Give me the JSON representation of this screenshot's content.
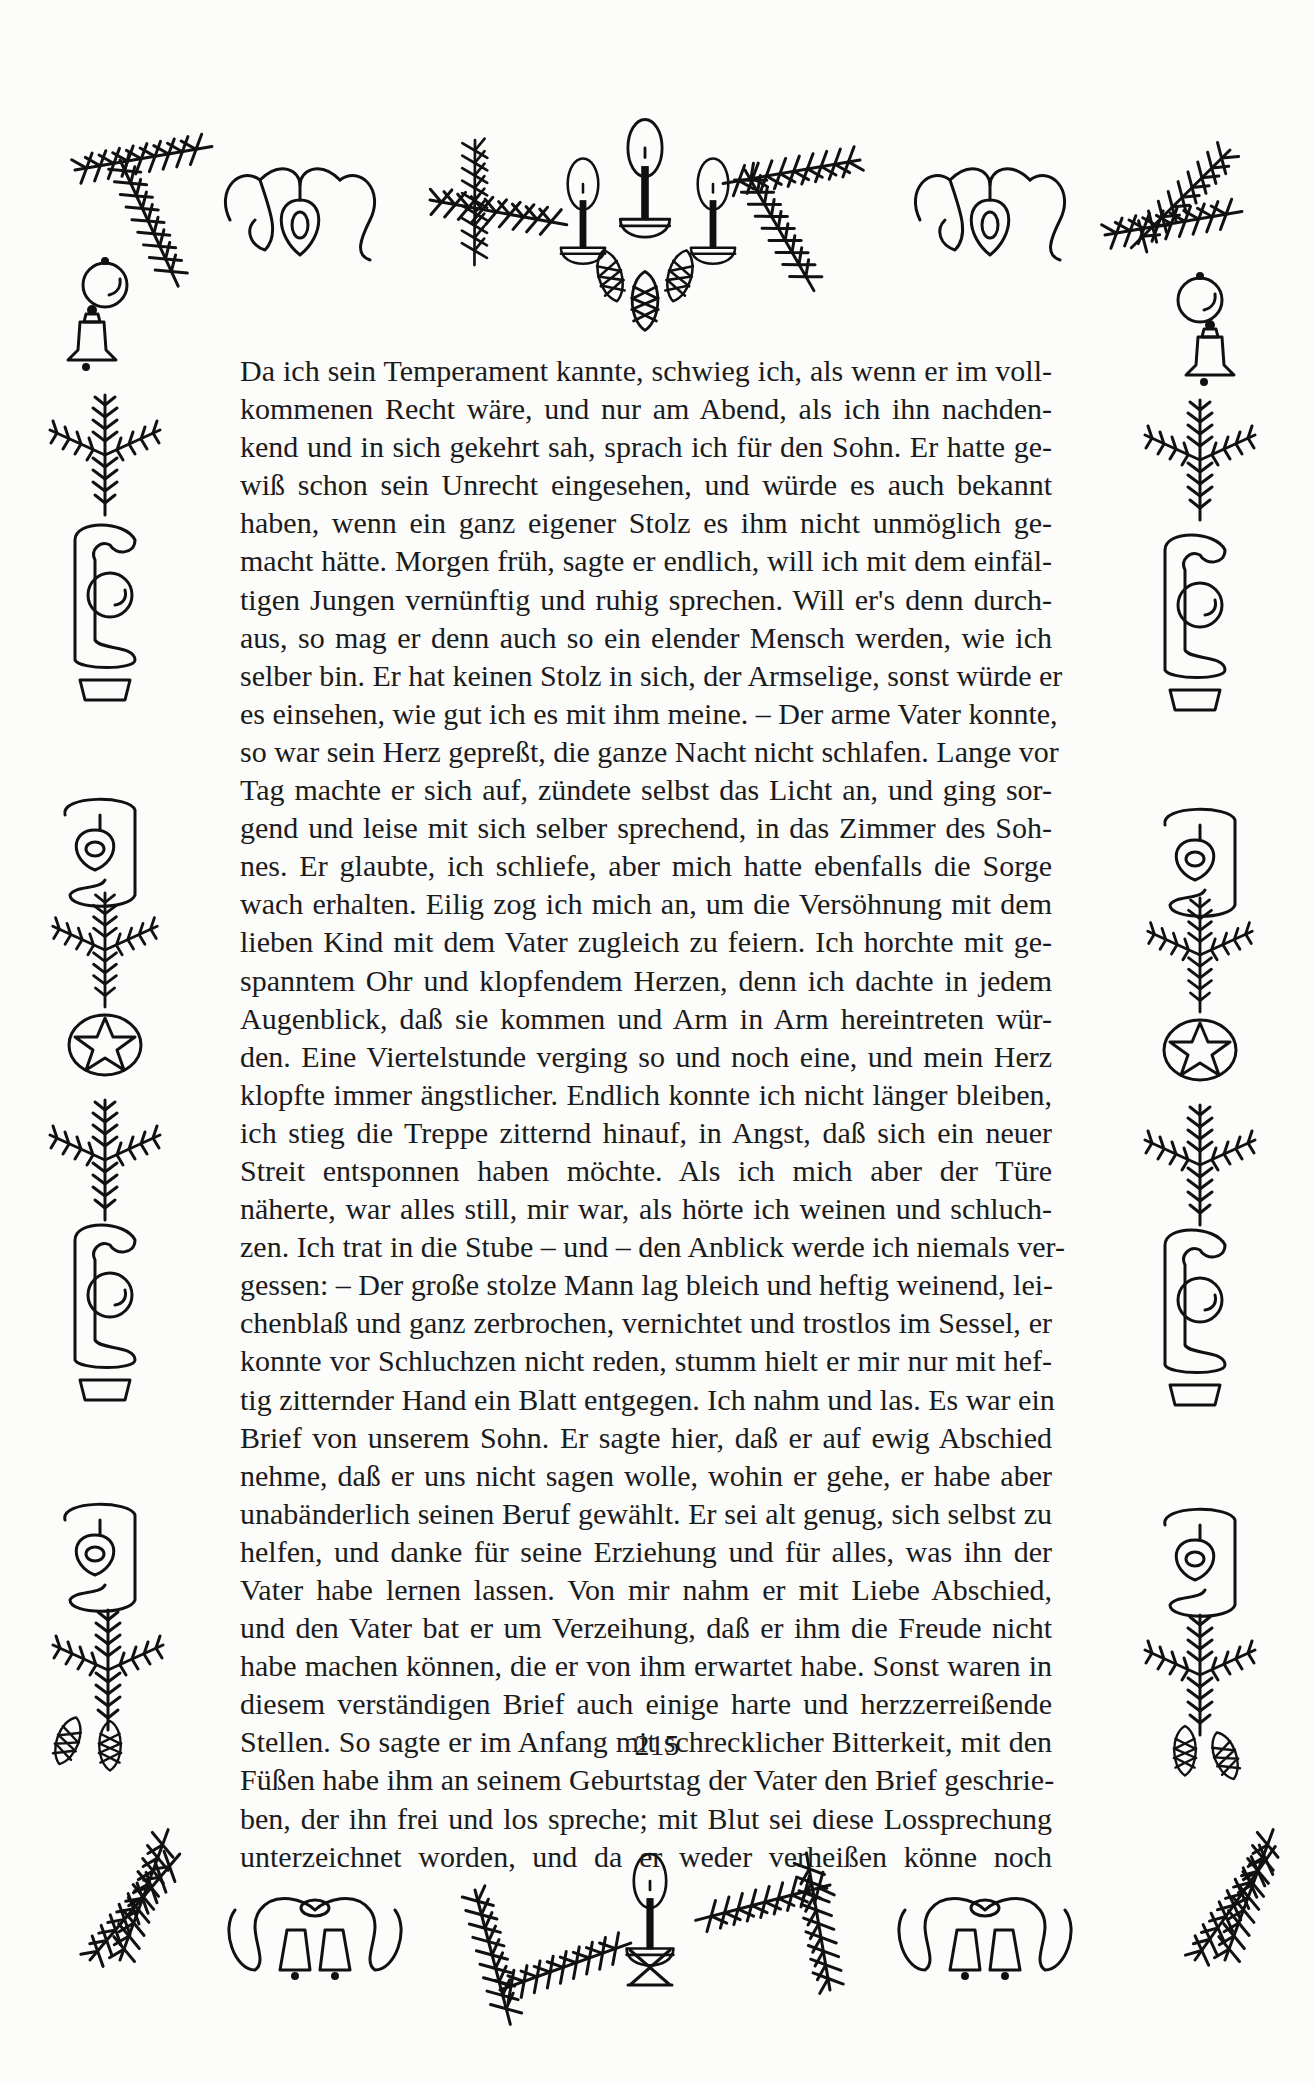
{
  "document": {
    "page_number": "215",
    "lines": [
      "Da ich sein Temperament kannte, schwieg ich, als wenn er im voll-",
      "kommenen Recht wäre, und nur am Abend, als ich ihn nachden-",
      "kend und in sich gekehrt sah, sprach ich für den Sohn. Er hatte ge-",
      "wiß schon sein Unrecht eingesehen, und würde es auch bekannt",
      "haben, wenn ein ganz eigener Stolz es ihm nicht unmöglich ge-",
      "macht hätte. Morgen früh, sagte er endlich, will ich mit dem einfäl-",
      "tigen Jungen vernünftig und ruhig sprechen. Will er's denn durch-",
      "aus, so mag er denn auch so ein elender Mensch werden, wie ich",
      "selber bin. Er hat keinen Stolz in sich, der Armselige, sonst würde er",
      "es einsehen, wie gut ich es mit ihm meine. – Der arme Vater konnte,",
      "so war sein Herz gepreßt, die ganze Nacht nicht schlafen. Lange vor",
      "Tag machte er sich auf, zündete selbst das Licht an, und ging sor-",
      "gend und leise mit sich selber sprechend, in das Zimmer des Soh-",
      "nes. Er glaubte, ich schliefe, aber mich hatte ebenfalls die Sorge",
      "wach erhalten. Eilig zog ich mich an, um die Versöhnung mit dem",
      "lieben Kind mit dem Vater zugleich zu feiern. Ich horchte mit ge-",
      "spanntem Ohr und klopfendem Herzen, denn ich dachte in jedem",
      "Augenblick, daß sie kommen und Arm in Arm hereintreten wür-",
      "den. Eine Viertelstunde verging so und noch eine, und mein Herz",
      "klopfte immer ängstlicher. Endlich konnte ich nicht länger bleiben,",
      "ich stieg die Treppe zitternd hinauf, in Angst, daß sich ein neuer",
      "Streit entsponnen haben möchte. Als ich mich aber der Türe",
      "näherte, war alles still, mir war, als hörte ich weinen und schluch-",
      "zen. Ich trat in die Stube – und – den Anblick werde ich niemals ver-",
      "gessen: – Der große stolze Mann lag bleich und heftig weinend, lei-",
      "chenblaß und ganz zerbrochen, vernichtet und trostlos im Sessel, er",
      "konnte vor Schluchzen nicht reden, stumm hielt er mir nur mit hef-",
      "tig zitternder Hand ein Blatt entgegen. Ich nahm und las. Es war ein",
      "Brief von unserem Sohn. Er sagte hier, daß er auf ewig Abschied",
      "nehme, daß er uns nicht sagen wolle, wohin er gehe, er habe aber",
      "unabänderlich seinen Beruf gewählt. Er sei alt genug, sich selbst zu",
      "helfen, und danke für seine Erziehung und für alles, was ihn der",
      "Vater habe lernen lassen. Von mir nahm er mit Liebe Abschied,",
      "und den Vater bat er um Verzeihung, daß er ihm die Freude nicht",
      "habe machen können, die er von ihm erwartet habe. Sonst waren in",
      "diesem verständigen Brief auch einige harte und herzzerreißende",
      "Stellen. So sagte er im Anfang mit schrecklicher Bitterkeit, mit den",
      "Füßen habe ihm an seinem Geburtstag der Vater den Brief geschrie-",
      "ben, der ihn frei und los spreche; mit Blut sei diese Lossprechung",
      "unterzeichnet worden, und da er weder verheißen könne noch"
    ]
  },
  "border": {
    "top": [
      "fir-branch-icon",
      "ribbon-bow-icon",
      "heart-ornament-icon",
      "fir-branch-icon",
      "three-candles-icon",
      "pine-cones-icon",
      "fir-branch-icon",
      "ribbon-bow-icon",
      "heart-ornament-icon",
      "fir-branch-icon"
    ],
    "sides": [
      "bauble-icon",
      "bell-icon",
      "fir-sprig-icon",
      "ribbon-scroll-icon",
      "bauble-icon",
      "heart-ornament-icon",
      "fir-sprig-icon",
      "star-ornament-icon",
      "fir-sprig-icon",
      "ribbon-scroll-icon",
      "bauble-icon",
      "heart-ornament-icon",
      "fir-sprig-icon",
      "pine-cones-icon",
      "fir-branch-icon"
    ],
    "bottom": [
      "fir-branch-icon",
      "ribbon-bow-icon",
      "bells-icon",
      "fir-branch-icon",
      "single-candle-icon",
      "fir-branch-icon",
      "ribbon-bow-icon",
      "bells-icon",
      "fir-branch-icon"
    ],
    "ink_color": "#111111",
    "paper_color": "#fcfcfb"
  }
}
